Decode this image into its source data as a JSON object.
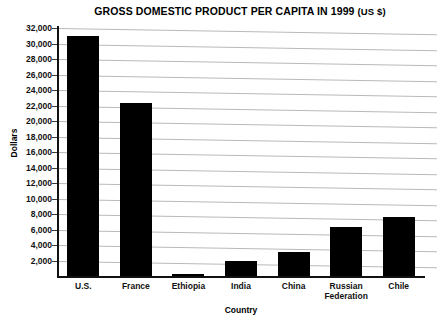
{
  "chart_data": {
    "type": "bar",
    "title": "GROSS DOMESTIC PRODUCT PER CAPITA IN 1999 (US $)",
    "title_main": "GROSS DOMESTIC PRODUCT PER CAPITA IN 1999",
    "title_suffix": "(US $)",
    "xlabel": "Country",
    "ylabel": "Dollars",
    "categories": [
      "U.S.",
      "France",
      "Ethiopia",
      "India",
      "China",
      "Russian Federation",
      "Chile"
    ],
    "values": [
      31000,
      22300,
      300,
      1900,
      3100,
      6300,
      7600
    ],
    "ylim": [
      0,
      32000
    ],
    "ytick_step": 2000,
    "ytick_labels": [
      "32,000",
      "30,000",
      "28,000",
      "26,000",
      "24,000",
      "22,000",
      "20,000",
      "18,000",
      "16,000",
      "14,000",
      "12,000",
      "10,000",
      "8,000",
      "6,000",
      "4,000",
      "2,000"
    ],
    "ytick_values": [
      32000,
      30000,
      28000,
      26000,
      24000,
      22000,
      20000,
      18000,
      16000,
      14000,
      12000,
      10000,
      8000,
      6000,
      4000,
      2000
    ],
    "grid": true,
    "legend": false,
    "bar_color": "#000000",
    "grid_color": "#b9b9b9",
    "axis_color": "#111111",
    "background": "#ffffff"
  }
}
